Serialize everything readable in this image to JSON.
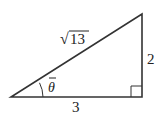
{
  "diagram": {
    "type": "right-triangle",
    "labels": {
      "hypotenuse": "13",
      "hypotenuse_radical": "√",
      "opposite": "2",
      "adjacent": "3",
      "angle": "θ"
    },
    "colors": {
      "stroke": "#333333",
      "text": "#222222",
      "background": "#ffffff"
    }
  }
}
